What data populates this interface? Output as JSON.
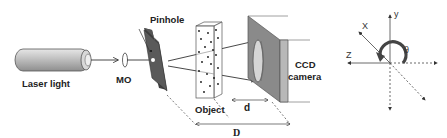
{
  "diagram": {
    "labels": {
      "laser": "Laser light",
      "mo": "MO",
      "pinhole": "Pinhole",
      "object": "Object",
      "ccd_line1": "CCD",
      "ccd_line2": "camera",
      "d_small": "d",
      "d_large": "D"
    },
    "axes": {
      "x": "X",
      "y": "y",
      "z": "Z",
      "theta": "θ"
    },
    "colors": {
      "line": "#333333",
      "plate": "#555555",
      "camera_face": "#8a8a8a",
      "camera_side": "#b8b8b8",
      "laser_body": "#bdbdbd"
    }
  }
}
